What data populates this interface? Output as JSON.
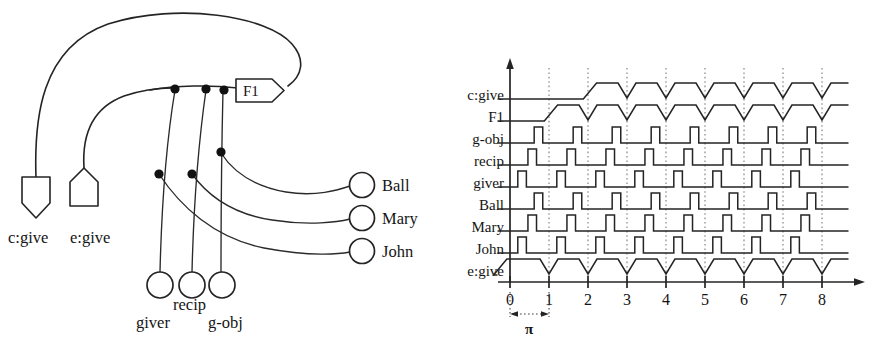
{
  "figure": {
    "title": "",
    "panels": [
      "network-diagram",
      "timing-diagram"
    ]
  },
  "network": {
    "concept_node": {
      "label": "c:give",
      "shape": "pentagon-down"
    },
    "event_node": {
      "label": "e:give",
      "shape": "pentagon-up"
    },
    "frame_tag": {
      "label": "F1",
      "shape": "tag-right-point"
    },
    "role_nodes": [
      {
        "label": "giver",
        "shape": "circle"
      },
      {
        "label": "recip",
        "shape": "circle"
      },
      {
        "label": "g-obj",
        "shape": "circle"
      }
    ],
    "filler_nodes": [
      {
        "label": "Ball",
        "shape": "circle"
      },
      {
        "label": "Mary",
        "shape": "circle"
      },
      {
        "label": "John",
        "shape": "circle"
      }
    ],
    "junction_count": 6
  },
  "chart_data": {
    "type": "line",
    "title": "",
    "xlabel": "",
    "ylabel": "",
    "xlim": [
      -0.45,
      8.75
    ],
    "grid": true,
    "legend_position": "left-row-labels",
    "period_annotation": {
      "label": "π",
      "from": 0,
      "to": 1
    },
    "x_ticks": [
      "0",
      "1",
      "2",
      "3",
      "4",
      "5",
      "6",
      "7",
      "8"
    ],
    "x_tick_values": [
      0,
      1,
      2,
      3,
      4,
      5,
      6,
      7,
      8
    ],
    "gridline_x": [
      1,
      2,
      3,
      4,
      5,
      6,
      7,
      8
    ],
    "series": [
      {
        "name": "c:give",
        "waveform": "sustained-with-dips",
        "rise_at": 2,
        "dips_at": [
          3,
          4,
          5,
          6,
          7,
          8
        ],
        "values": [
          0,
          0,
          1,
          1,
          1,
          1,
          1,
          1,
          1
        ]
      },
      {
        "name": "F1",
        "waveform": "sustained-with-dips",
        "rise_at": 1,
        "dips_at": [
          2,
          3,
          4,
          5,
          6,
          7,
          8
        ],
        "values": [
          0,
          1,
          1,
          1,
          1,
          1,
          1,
          1,
          1
        ]
      },
      {
        "name": "g-obj",
        "waveform": "pulse-train",
        "phase_offset": 0.62,
        "pulse_width": 0.22,
        "pulses_at": [
          0.62,
          1.62,
          2.62,
          3.62,
          4.62,
          5.62,
          6.62,
          7.62
        ],
        "values": [
          1,
          1,
          1,
          1,
          1,
          1,
          1,
          1
        ]
      },
      {
        "name": "recip",
        "waveform": "pulse-train",
        "phase_offset": 0.46,
        "pulse_width": 0.22,
        "pulses_at": [
          0.46,
          1.46,
          2.46,
          3.46,
          4.46,
          5.46,
          6.46,
          7.46
        ],
        "values": [
          1,
          1,
          1,
          1,
          1,
          1,
          1,
          1
        ]
      },
      {
        "name": "giver",
        "waveform": "pulse-train",
        "phase_offset": 0.2,
        "pulse_width": 0.22,
        "pulses_at": [
          0.2,
          1.2,
          2.2,
          3.2,
          4.2,
          5.2,
          6.2,
          7.2
        ],
        "values": [
          1,
          1,
          1,
          1,
          1,
          1,
          1,
          1
        ]
      },
      {
        "name": "Ball",
        "waveform": "pulse-train",
        "phase_offset": 0.62,
        "pulse_width": 0.22,
        "pulses_at": [
          0.62,
          1.62,
          2.62,
          3.62,
          4.62,
          5.62,
          6.62,
          7.62
        ],
        "values": [
          1,
          1,
          1,
          1,
          1,
          1,
          1,
          1
        ]
      },
      {
        "name": "Mary",
        "waveform": "pulse-train",
        "phase_offset": 0.46,
        "pulse_width": 0.22,
        "pulses_at": [
          0.46,
          1.46,
          2.46,
          3.46,
          4.46,
          5.46,
          6.46,
          7.46
        ],
        "values": [
          1,
          1,
          1,
          1,
          1,
          1,
          1,
          1
        ]
      },
      {
        "name": "John",
        "waveform": "pulse-train",
        "phase_offset": 0.2,
        "pulse_width": 0.22,
        "pulses_at": [
          0.2,
          1.2,
          2.2,
          3.2,
          4.2,
          5.2,
          6.2,
          7.2
        ],
        "values": [
          1,
          1,
          1,
          1,
          1,
          1,
          1,
          1
        ]
      },
      {
        "name": "e:give",
        "waveform": "sustained-with-dips",
        "rise_at": -0.3,
        "dips_at": [
          1,
          2,
          3,
          4,
          5,
          6,
          7,
          8
        ],
        "values": [
          1,
          1,
          1,
          1,
          1,
          1,
          1,
          1,
          1
        ]
      }
    ]
  },
  "colors": {
    "ink": "#242424",
    "grid": "#7a7a7a",
    "paper": "#ffffff"
  }
}
